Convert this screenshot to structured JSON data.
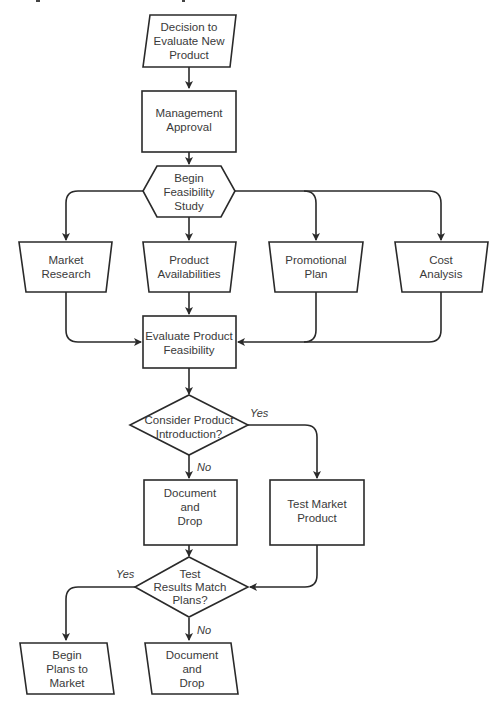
{
  "diagram": {
    "type": "flowchart",
    "nodes": {
      "start": {
        "shape": "parallelogram",
        "lines": [
          "Decision to",
          "Evaluate New",
          "Product"
        ]
      },
      "approval": {
        "shape": "rectangle",
        "lines": [
          "Management",
          "Approval"
        ]
      },
      "feasibility_start": {
        "shape": "hexagon",
        "lines": [
          "Begin",
          "Feasibility",
          "Study"
        ]
      },
      "market_research": {
        "shape": "trapezoid",
        "lines": [
          "Market",
          "Research"
        ]
      },
      "product_avail": {
        "shape": "trapezoid",
        "lines": [
          "Product",
          "Availabilities"
        ]
      },
      "promo_plan": {
        "shape": "trapezoid",
        "lines": [
          "Promotional",
          "Plan"
        ]
      },
      "cost_analysis": {
        "shape": "trapezoid",
        "lines": [
          "Cost",
          "Analysis"
        ]
      },
      "evaluate": {
        "shape": "rectangle",
        "lines": [
          "Evaluate Product",
          "Feasibility"
        ]
      },
      "consider": {
        "shape": "diamond",
        "lines": [
          "Consider Product",
          "Introduction?"
        ]
      },
      "doc_drop_1": {
        "shape": "rectangle",
        "lines": [
          "Document",
          "and",
          "Drop"
        ]
      },
      "test_market": {
        "shape": "rectangle",
        "lines": [
          "Test Market",
          "Product"
        ]
      },
      "test_results": {
        "shape": "diamond",
        "lines": [
          "Test",
          "Results Match",
          "Plans?"
        ]
      },
      "begin_plans": {
        "shape": "parallelogram",
        "lines": [
          "Begin",
          "Plans to",
          "Market"
        ]
      },
      "doc_drop_2": {
        "shape": "parallelogram",
        "lines": [
          "Document",
          "and",
          "Drop"
        ]
      }
    },
    "edge_labels": {
      "consider_yes": "Yes",
      "consider_no": "No",
      "results_yes": "Yes",
      "results_no": "No"
    },
    "edges": [
      [
        "start",
        "approval"
      ],
      [
        "approval",
        "feasibility_start"
      ],
      [
        "feasibility_start",
        "market_research"
      ],
      [
        "feasibility_start",
        "product_avail"
      ],
      [
        "feasibility_start",
        "promo_plan"
      ],
      [
        "feasibility_start",
        "cost_analysis"
      ],
      [
        "market_research",
        "evaluate"
      ],
      [
        "product_avail",
        "evaluate"
      ],
      [
        "promo_plan",
        "evaluate"
      ],
      [
        "cost_analysis",
        "evaluate"
      ],
      [
        "evaluate",
        "consider"
      ],
      [
        "consider",
        "test_market",
        "Yes"
      ],
      [
        "consider",
        "doc_drop_1",
        "No"
      ],
      [
        "doc_drop_1",
        "test_results"
      ],
      [
        "test_market",
        "test_results"
      ],
      [
        "test_results",
        "begin_plans",
        "Yes"
      ],
      [
        "test_results",
        "doc_drop_2",
        "No"
      ]
    ],
    "colors": {
      "stroke": "#2a2a2a",
      "text": "#3a3a3a",
      "fill": "#ffffff"
    }
  }
}
